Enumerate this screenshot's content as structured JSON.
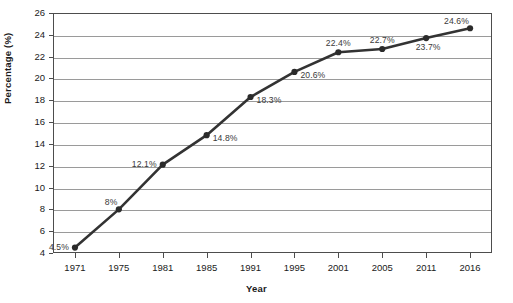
{
  "chart_data": {
    "type": "line",
    "title": "",
    "xlabel": "Year",
    "ylabel": "Percentage (%)",
    "categories": [
      "1971",
      "1975",
      "1981",
      "1985",
      "1991",
      "1995",
      "2001",
      "2005",
      "2011",
      "2016"
    ],
    "values": [
      4.5,
      8,
      12.1,
      14.8,
      18.3,
      20.6,
      22.4,
      22.7,
      23.7,
      24.6
    ],
    "data_labels": [
      "4.5%",
      "8%",
      "12.1%",
      "14.8%",
      "18.3%",
      "20.6%",
      "22.4%",
      "22.7%",
      "23.7%",
      "24.6%"
    ],
    "label_positions": [
      "left",
      "above-left",
      "left",
      "right",
      "right",
      "right",
      "above",
      "above",
      "below-right",
      "above-left"
    ],
    "ylim": [
      4,
      26
    ],
    "ytick_step": 2,
    "yticks": [
      "26",
      "24",
      "22",
      "20",
      "18",
      "16",
      "14",
      "12",
      "10",
      "8",
      "6",
      "4"
    ],
    "grid": true,
    "legend": "none",
    "series": [
      {
        "name": "Percentage",
        "values": [
          4.5,
          8,
          12.1,
          14.8,
          18.3,
          20.6,
          22.4,
          22.7,
          23.7,
          24.6
        ]
      }
    ],
    "colors": {
      "line": "#333333",
      "marker": "#2b2b2b",
      "gridline": "#9a9a9a",
      "axis": "#4d4d4d",
      "text": "#1a1a1a",
      "label_text": "#3a3a3a",
      "background": "#ffffff"
    }
  },
  "axes": {
    "x_title": "Year",
    "y_title": "Percentage (%)"
  }
}
